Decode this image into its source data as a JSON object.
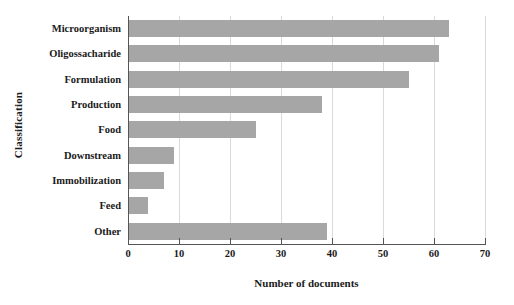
{
  "chart_data": {
    "type": "bar",
    "orientation": "horizontal",
    "title": "",
    "xlabel": "Number of documents",
    "ylabel": "Classification",
    "categories": [
      "Microorganism",
      "Oligossacharide",
      "Formulation",
      "Production",
      "Food",
      "Downstream",
      "Immobilization",
      "Feed",
      "Other"
    ],
    "values": [
      63,
      61,
      55,
      38,
      25,
      9,
      7,
      4,
      39
    ],
    "xlim": [
      0,
      70
    ],
    "xticks": [
      0,
      10,
      20,
      30,
      40,
      50,
      60,
      70
    ],
    "xticklabels": [
      "0",
      "10",
      "20",
      "30",
      "40",
      "50",
      "60",
      "70"
    ],
    "grid": "vertical",
    "legend": "none",
    "bar_color": "#a6a6a6",
    "gridline_color": "#d9d9d9",
    "axis_color": "#555555",
    "text_color": "#1a1a1a"
  }
}
